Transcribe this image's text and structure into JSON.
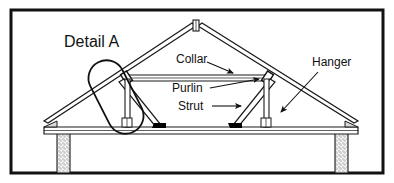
{
  "figure": {
    "title": "Detail A",
    "kind": "roof-truss-cross-section",
    "border_color": "#111111",
    "background_color": "#ffffff",
    "line_color": "#1a1a1a",
    "fill_color": "#ffffff",
    "joint_color": "#000000",
    "wall_hatch_color": "#8a8a8a"
  },
  "labels": {
    "detail": "Detail A",
    "collar": "Collar",
    "purlin": "Purlin",
    "strut": "Strut",
    "hanger": "Hanger"
  },
  "members": [
    {
      "name": "ridge-post",
      "label": "Ridge post"
    },
    {
      "name": "rafter-left",
      "label": "Rafter (left)"
    },
    {
      "name": "rafter-right",
      "label": "Rafter (right)"
    },
    {
      "name": "collar-beam",
      "label": "Collar"
    },
    {
      "name": "purlin-left",
      "label": "Purlin (left)"
    },
    {
      "name": "purlin-right",
      "label": "Purlin (right)"
    },
    {
      "name": "strut-left",
      "label": "Strut (left)"
    },
    {
      "name": "strut-right",
      "label": "Strut (right)"
    },
    {
      "name": "hanger-left",
      "label": "Hanger (left)"
    },
    {
      "name": "hanger-right",
      "label": "Hanger (right)"
    },
    {
      "name": "tie-beam",
      "label": "Tie beam"
    },
    {
      "name": "wall-left",
      "label": "Masonry wall (left)"
    },
    {
      "name": "wall-right",
      "label": "Masonry wall (right)"
    }
  ],
  "callout": {
    "name": "detail-oval",
    "shape": "rotated-stadium",
    "note": "Highlight ring around left purlin / hanger joint"
  }
}
